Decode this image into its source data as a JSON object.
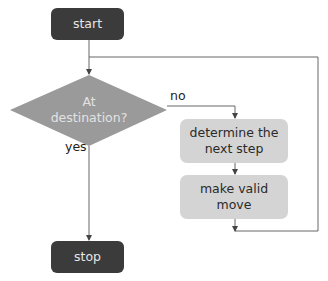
{
  "diagram": {
    "type": "flowchart",
    "nodes": {
      "start": {
        "label": "start",
        "shape": "terminal"
      },
      "decision": {
        "label_line1": "At",
        "label_line2": "destination?",
        "shape": "diamond"
      },
      "determine": {
        "label_line1": "determine the",
        "label_line2": "next step",
        "shape": "process"
      },
      "move": {
        "label_line1": "make valid",
        "label_line2": "move",
        "shape": "process"
      },
      "stop": {
        "label": "stop",
        "shape": "terminal"
      }
    },
    "edges": {
      "no_label": "no",
      "yes_label": "yes"
    },
    "colors": {
      "terminal_fill": "#3b3b3b",
      "decision_fill": "#9a9a9a",
      "process_fill": "#d4d4d4",
      "line": "#555555"
    }
  }
}
